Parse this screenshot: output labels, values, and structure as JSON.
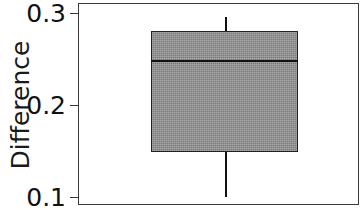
{
  "chart_data": {
    "type": "box",
    "title": "",
    "xlabel": "",
    "ylabel": "Difference",
    "ylim": [
      0.1,
      0.3
    ],
    "yticks": [
      0.3,
      0.2,
      0.1
    ],
    "ytick_labels": [
      "0.3",
      "0.2",
      "0.1"
    ],
    "xticks": [],
    "xtick_labels": [],
    "grid": false,
    "legend": null,
    "frame": "full-box",
    "box_fill_color": "#8b8b8b",
    "line_color": "#111111",
    "axis_color": "#3a3a3a",
    "background_color": "#ffffff",
    "boxes": [
      {
        "label": "",
        "whisker_low": 0.101,
        "q1": 0.15,
        "median": 0.25,
        "q3": 0.281,
        "whisker_high": 0.297,
        "outliers": []
      }
    ]
  },
  "axis": {
    "y_label": "Difference",
    "tick_0": "0.3",
    "tick_1": "0.2",
    "tick_2": "0.1"
  }
}
